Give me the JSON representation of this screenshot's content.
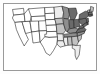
{
  "figure": {
    "kind": "map-thumbnail",
    "frame": {
      "border_color": "#9a9a9a",
      "background_color": "#ffffff"
    },
    "canvas": {
      "width": 100,
      "height": 74,
      "background_color": "#ffffff"
    }
  },
  "map": {
    "name": "united-states-choropleth",
    "projection_note": "contiguous united states",
    "outline_color": "#1a1a1a",
    "shading_scale": [
      {
        "class": "fill-light",
        "color": "#ffffff",
        "label": "lowest"
      },
      {
        "class": "fill-pale",
        "color": "#ededed",
        "label": "low"
      },
      {
        "class": "fill-mid",
        "color": "#c2c2c2",
        "label": "medium"
      },
      {
        "class": "fill-dark",
        "color": "#8e8e8e",
        "label": "high"
      },
      {
        "class": "fill-darker",
        "color": "#6a6a6a",
        "label": "highest"
      }
    ],
    "regions": [
      {
        "code": "WA",
        "name": "Washington",
        "shade": "fill-light",
        "d": "M12.5,9.5 L23.5,8.3 L24.2,14.0 L13.6,15.2 Z"
      },
      {
        "code": "OR",
        "name": "Oregon",
        "shade": "fill-light",
        "d": "M13.6,15.2 L24.2,14.0 L25.0,21.5 L14.8,22.4 L12.4,18.0 Z"
      },
      {
        "code": "CA",
        "name": "California",
        "shade": "fill-light",
        "d": "M14.8,22.4 L22.0,21.8 L25.6,33.5 L28.4,39.5 L24.2,46.0 L19.6,37.0 L16.4,29.5 Z"
      },
      {
        "code": "NV",
        "name": "Nevada",
        "shade": "fill-light",
        "d": "M22.0,21.8 L29.8,21.0 L31.6,32.0 L25.6,33.5 Z"
      },
      {
        "code": "ID",
        "name": "Idaho",
        "shade": "fill-light",
        "d": "M24.2,14.0 L28.4,8.9 L32.4,10.0 L31.2,16.6 L30.2,21.1 L25.0,21.5 Z"
      },
      {
        "code": "MT",
        "name": "Montana",
        "shade": "fill-light",
        "d": "M28.4,8.9 L44.6,7.6 L45.2,16.0 L31.2,16.6 Z"
      },
      {
        "code": "WY",
        "name": "Wyoming",
        "shade": "fill-light",
        "d": "M31.2,16.6 L45.2,16.0 L45.8,24.0 L32.0,24.6 Z"
      },
      {
        "code": "UT",
        "name": "Utah",
        "shade": "fill-light",
        "d": "M30.0,21.3 L38.6,21.0 L39.2,31.0 L31.6,32.0 Z"
      },
      {
        "code": "AZ",
        "name": "Arizona",
        "shade": "fill-light",
        "d": "M31.6,32.0 L39.2,31.0 L40.2,42.0 L33.0,43.0 Z"
      },
      {
        "code": "CO",
        "name": "Colorado",
        "shade": "fill-light",
        "d": "M38.6,21.0 L48.0,20.6 L48.6,30.5 L39.2,31.0 Z"
      },
      {
        "code": "NM",
        "name": "New Mexico",
        "shade": "fill-light",
        "d": "M39.2,31.0 L48.6,30.5 L49.2,41.3 L40.2,42.0 Z"
      },
      {
        "code": "ND",
        "name": "North Dakota",
        "shade": "fill-light",
        "d": "M44.6,7.6 L54.0,7.2 L54.5,13.2 L45.0,13.6 Z"
      },
      {
        "code": "SD",
        "name": "South Dakota",
        "shade": "fill-light",
        "d": "M45.0,13.6 L54.5,13.2 L55.0,19.4 L45.4,19.8 Z"
      },
      {
        "code": "NE",
        "name": "Nebraska",
        "shade": "fill-light",
        "d": "M45.4,19.8 L55.0,19.4 L56.2,25.0 L46.0,25.4 Z"
      },
      {
        "code": "KS",
        "name": "Kansas",
        "shade": "fill-light",
        "d": "M46.0,25.4 L56.2,25.0 L56.8,31.4 L46.6,31.6 Z"
      },
      {
        "code": "OK",
        "name": "Oklahoma",
        "shade": "fill-light",
        "d": "M46.6,31.6 L56.8,31.4 L57.5,37.0 L49.0,37.4 L44.8,36.8 L44.8,34.2 L46.6,34.2 Z"
      },
      {
        "code": "TX",
        "name": "Texas",
        "shade": "fill-light",
        "d": "M40.2,42.0 L44.8,36.8 L49.0,37.4 L57.5,37.0 L57.0,44.0 L53.5,50.5 L50.0,55.5 L46.0,53.0 L43.5,47.5 Z"
      },
      {
        "code": "MN",
        "name": "Minnesota",
        "shade": "fill-pale",
        "d": "M54.0,7.2 L62.0,6.2 L63.6,12.5 L62.4,18.2 L54.7,18.6 L54.5,13.2 Z"
      },
      {
        "code": "IA",
        "name": "Iowa",
        "shade": "fill-mid",
        "d": "M54.7,18.6 L62.4,18.2 L63.6,23.8 L56.2,24.4 Z"
      },
      {
        "code": "MO",
        "name": "Missouri",
        "shade": "fill-mid",
        "d": "M56.2,24.4 L63.6,23.8 L65.6,30.5 L63.0,34.0 L57.0,33.8 L56.8,31.4 Z"
      },
      {
        "code": "AR",
        "name": "Arkansas",
        "shade": "fill-pale",
        "d": "M57.0,33.8 L63.0,34.0 L63.6,40.8 L57.5,40.8 L57.5,37.0 Z"
      },
      {
        "code": "LA",
        "name": "Louisiana",
        "shade": "fill-pale",
        "d": "M57.5,40.8 L63.6,40.8 L65.2,45.8 L60.0,47.2 L57.0,44.0 Z"
      },
      {
        "code": "WI",
        "name": "Wisconsin",
        "shade": "fill-dark",
        "d": "M62.0,6.2 L68.2,8.0 L69.6,14.2 L68.2,19.0 L63.6,18.4 L63.6,12.5 Z"
      },
      {
        "code": "IL",
        "name": "Illinois",
        "shade": "fill-dark",
        "d": "M63.6,18.4 L68.4,19.2 L69.4,27.5 L67.2,32.0 L65.6,30.5 L63.6,23.8 Z"
      },
      {
        "code": "MI",
        "name": "Michigan",
        "shade": "fill-darker",
        "d": "M68.4,8.4 L75.8,8.0 L77.2,13.4 L74.6,19.4 L70.6,19.8 L69.3,14.4 Z"
      },
      {
        "code": "IN",
        "name": "Indiana",
        "shade": "fill-darker",
        "d": "M69.4,19.6 L73.6,19.8 L74.2,28.5 L69.6,28.8 Z"
      },
      {
        "code": "OH",
        "name": "Ohio",
        "shade": "fill-darker",
        "d": "M73.6,19.8 L79.0,19.2 L79.6,26.2 L74.4,28.0 Z"
      },
      {
        "code": "KY",
        "name": "Kentucky",
        "shade": "fill-dark",
        "d": "M67.2,32.0 L69.6,28.8 L74.4,28.0 L78.4,29.0 L76.0,32.4 L70.6,33.4 Z"
      },
      {
        "code": "TN",
        "name": "Tennessee",
        "shade": "fill-dark",
        "d": "M63.6,34.4 L70.6,33.4 L77.2,32.8 L77.4,36.2 L64.2,37.2 Z"
      },
      {
        "code": "MS",
        "name": "Mississippi",
        "shade": "fill-pale",
        "d": "M63.6,37.4 L67.4,37.2 L68.2,45.2 L65.2,45.8 L63.6,40.8 Z"
      },
      {
        "code": "AL",
        "name": "Alabama",
        "shade": "fill-mid",
        "d": "M67.4,37.2 L71.6,36.8 L72.4,45.0 L68.2,45.2 Z"
      },
      {
        "code": "GA",
        "name": "Georgia",
        "shade": "fill-mid",
        "d": "M71.6,36.8 L77.4,36.2 L78.6,41.8 L76.6,45.6 L72.4,45.0 Z"
      },
      {
        "code": "FL",
        "name": "Florida",
        "shade": "fill-pale",
        "d": "M72.4,45.0 L76.6,45.6 L80.4,45.2 L80.0,48.5 L79.2,55.0 L76.6,59.5 L75.2,56.0 L75.0,49.6 L72.2,48.2 Z"
      },
      {
        "code": "SC",
        "name": "South Carolina",
        "shade": "fill-mid",
        "d": "M77.4,36.2 L81.8,34.4 L81.2,39.0 L78.6,41.8 Z"
      },
      {
        "code": "NC",
        "name": "North Carolina",
        "shade": "fill-dark",
        "d": "M77.2,32.8 L85.0,31.0 L84.2,33.4 L81.8,34.4 L77.4,36.2 Z"
      },
      {
        "code": "VA",
        "name": "Virginia",
        "shade": "fill-darker",
        "d": "M76.0,32.4 L78.4,29.0 L84.0,27.4 L86.2,29.8 L85.0,31.0 L77.2,32.8 Z"
      },
      {
        "code": "WV",
        "name": "West Virginia",
        "shade": "fill-darker",
        "d": "M78.4,29.0 L79.6,26.2 L82.6,25.2 L84.2,27.0 L84.0,27.4 Z"
      },
      {
        "code": "PA",
        "name": "Pennsylvania",
        "shade": "fill-darker",
        "d": "M79.0,19.2 L86.0,18.2 L86.8,22.4 L82.6,25.2 L79.6,22.6 Z"
      },
      {
        "code": "NY",
        "name": "New York",
        "shade": "fill-darker",
        "d": "M79.4,14.6 L85.4,11.2 L89.6,12.0 L88.2,16.0 L86.0,18.2 L79.0,19.2 Z"
      },
      {
        "code": "VT",
        "name": "Vermont",
        "shade": "fill-mid",
        "d": "M87.4,10.4 L89.4,9.8 L89.8,12.2 L88.0,12.6 Z"
      },
      {
        "code": "NH",
        "name": "New Hampshire",
        "shade": "fill-mid",
        "d": "M89.4,9.8 L91.2,9.4 L91.8,12.0 L89.8,12.2 Z"
      },
      {
        "code": "ME",
        "name": "Maine",
        "shade": "fill-mid",
        "d": "M90.6,6.4 L93.6,7.4 L93.0,11.6 L91.2,12.0 L90.4,9.4 Z"
      },
      {
        "code": "MA",
        "name": "Massachusetts",
        "shade": "fill-darker",
        "d": "M88.2,12.8 L92.2,12.4 L92.4,14.4 L88.4,14.6 Z"
      },
      {
        "code": "RI",
        "name": "Rhode Island",
        "shade": "fill-darker",
        "d": "M91.4,14.6 L92.6,14.5 L92.7,15.8 L91.5,15.9 Z"
      },
      {
        "code": "CT",
        "name": "Connecticut",
        "shade": "fill-darker",
        "d": "M88.6,14.8 L91.2,14.7 L91.3,16.3 L88.7,16.4 Z"
      },
      {
        "code": "NJ",
        "name": "New Jersey",
        "shade": "fill-darker",
        "d": "M86.4,18.6 L88.2,18.0 L88.6,22.0 L86.9,22.6 Z"
      },
      {
        "code": "DE",
        "name": "Delaware",
        "shade": "fill-darker",
        "d": "M86.9,22.6 L88.1,22.2 L88.3,24.6 L87.2,24.8 Z"
      },
      {
        "code": "MD",
        "name": "Maryland",
        "shade": "fill-darker",
        "d": "M82.6,25.2 L86.8,22.4 L87.2,24.8 L84.2,27.0 Z"
      }
    ]
  }
}
